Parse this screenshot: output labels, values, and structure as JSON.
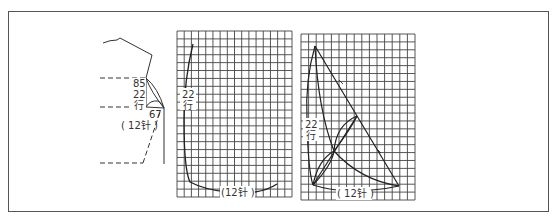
{
  "figure": {
    "panels": [
      {
        "id": "sleeve-cap-overview",
        "labels": {
          "top_value": "85",
          "rows_value": "22",
          "rows_unit": "行",
          "bottom_value": "67",
          "stitches": "( 12针 )"
        }
      },
      {
        "id": "grid-armhole-curve",
        "grid": {
          "cols": 16,
          "rows": 21
        },
        "labels": {
          "rows_value": "22",
          "rows_unit": "行",
          "stitches": "(12针 )"
        }
      },
      {
        "id": "grid-sleeve-cap",
        "grid": {
          "cols": 15,
          "rows": 21
        },
        "labels": {
          "rows_value": "22",
          "rows_unit": "行",
          "stitches": "( 12针 )"
        }
      }
    ],
    "colors": {
      "line": "#333333",
      "grid": "#444444",
      "frame": "#555555",
      "background": "#ffffff"
    }
  }
}
